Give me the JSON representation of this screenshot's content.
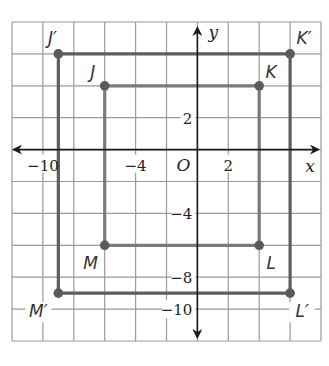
{
  "graph": {
    "x_axis_label": "x",
    "y_axis_label": "y",
    "origin_label": "O",
    "x_range": [
      -12,
      8
    ],
    "y_range": [
      -12,
      8
    ],
    "grid_step": 2,
    "x_tick_labels": [
      {
        "value": -10,
        "text": "−10"
      },
      {
        "value": -4,
        "text": "−4"
      },
      {
        "value": 2,
        "text": "2"
      }
    ],
    "y_tick_labels": [
      {
        "value": 2,
        "text": "2"
      },
      {
        "value": -4,
        "text": "−4"
      },
      {
        "value": -8,
        "text": "−8"
      },
      {
        "value": -10,
        "text": "−10"
      }
    ]
  },
  "figures": {
    "original": {
      "name": "JKLM",
      "color": "#7a7a7a",
      "vertices": [
        {
          "label": "J",
          "x": -6,
          "y": 4
        },
        {
          "label": "K",
          "x": 4,
          "y": 4
        },
        {
          "label": "L",
          "x": 4,
          "y": -6
        },
        {
          "label": "M",
          "x": -6,
          "y": -6
        }
      ]
    },
    "image": {
      "name": "J'K'L'M'",
      "color": "#5e5e5e",
      "vertices": [
        {
          "label": "J′",
          "x": -9,
          "y": 6
        },
        {
          "label": "K′",
          "x": 6,
          "y": 6
        },
        {
          "label": "L′",
          "x": 6,
          "y": -9
        },
        {
          "label": "M′",
          "x": -9,
          "y": -9
        }
      ]
    }
  },
  "colors": {
    "grid": "#9a9a9a",
    "axis": "#1a1a1a",
    "point_fill": "#5a5a5a"
  }
}
